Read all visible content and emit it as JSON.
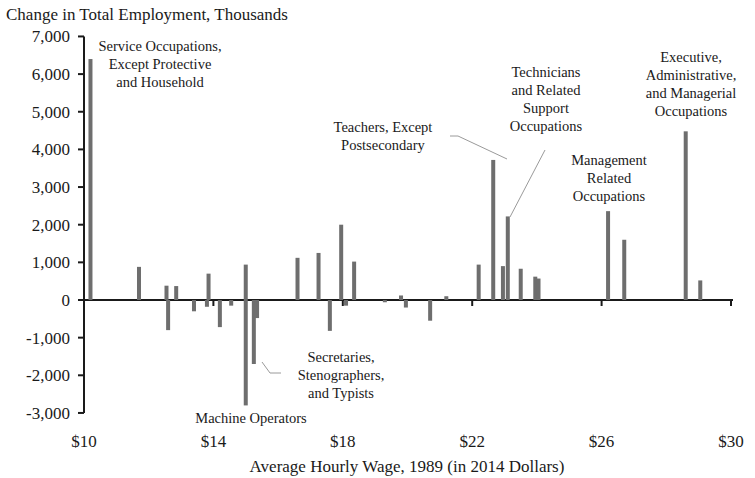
{
  "chart_data": {
    "type": "bar",
    "title": "",
    "ylabel": "Change in Total Employment, Thousands",
    "xlabel": "Average Hourly Wage, 1989 (in 2014 Dollars)",
    "ylim": [
      -3000,
      7000
    ],
    "xlim": [
      10,
      30
    ],
    "yticks": [
      7000,
      6000,
      5000,
      4000,
      3000,
      2000,
      1000,
      0,
      -1000,
      -2000,
      -3000
    ],
    "ytick_labels": [
      "7,000",
      "6,000",
      "5,000",
      "4,000",
      "3,000",
      "2,000",
      "1,000",
      "0",
      "-1,000",
      "-2,000",
      "-3,000"
    ],
    "xticks": [
      10,
      14,
      18,
      22,
      26,
      30
    ],
    "xtick_labels": [
      "$10",
      "$14",
      "$18",
      "$22",
      "$26",
      "$30"
    ],
    "grid": false,
    "legend": null,
    "points": [
      {
        "x": 10.2,
        "y": 6400
      },
      {
        "x": 11.7,
        "y": 880
      },
      {
        "x": 12.55,
        "y": 380
      },
      {
        "x": 12.6,
        "y": -800
      },
      {
        "x": 12.85,
        "y": 370
      },
      {
        "x": 13.4,
        "y": -300
      },
      {
        "x": 13.8,
        "y": -180
      },
      {
        "x": 13.85,
        "y": 700
      },
      {
        "x": 14.2,
        "y": -720
      },
      {
        "x": 14.55,
        "y": -150
      },
      {
        "x": 15.0,
        "y": 940
      },
      {
        "x": 15.0,
        "y": -2800
      },
      {
        "x": 15.25,
        "y": -1700
      },
      {
        "x": 15.35,
        "y": -480
      },
      {
        "x": 16.6,
        "y": 1120
      },
      {
        "x": 17.25,
        "y": 1250
      },
      {
        "x": 17.6,
        "y": -820
      },
      {
        "x": 17.95,
        "y": 2000
      },
      {
        "x": 18.1,
        "y": -150
      },
      {
        "x": 18.35,
        "y": 1020
      },
      {
        "x": 19.3,
        "y": -60
      },
      {
        "x": 19.8,
        "y": 120
      },
      {
        "x": 19.95,
        "y": -200
      },
      {
        "x": 20.7,
        "y": -550
      },
      {
        "x": 21.2,
        "y": 100
      },
      {
        "x": 22.2,
        "y": 940
      },
      {
        "x": 22.65,
        "y": 3720
      },
      {
        "x": 22.95,
        "y": 900
      },
      {
        "x": 23.1,
        "y": 2220
      },
      {
        "x": 23.5,
        "y": 830
      },
      {
        "x": 23.95,
        "y": 620
      },
      {
        "x": 24.05,
        "y": 570
      },
      {
        "x": 26.2,
        "y": 2360
      },
      {
        "x": 26.7,
        "y": 1600
      },
      {
        "x": 28.6,
        "y": 4480
      },
      {
        "x": 29.05,
        "y": 520
      }
    ],
    "annotations": [
      {
        "text": "Service Occupations, Except Protective and Household",
        "x": 10.2,
        "y": 6400
      },
      {
        "text": "Teachers, Except Postsecondary",
        "x": 22.65,
        "y": 3720
      },
      {
        "text": "Technicians and Related Support Occupations",
        "x": 23.1,
        "y": 2220
      },
      {
        "text": "Management Related Occupations",
        "x": 26.2,
        "y": 2360
      },
      {
        "text": "Executive, Administrative, and Managerial Occupations",
        "x": 28.6,
        "y": 4480
      },
      {
        "text": "Secretaries, Stenographers, and Typists",
        "x": 15.25,
        "y": -1700
      },
      {
        "text": "Machine Operators",
        "x": 15.0,
        "y": -2800
      }
    ]
  },
  "labels": {
    "ylabel": "Change in Total Employment, Thousands",
    "xlabel": "Average Hourly Wage, 1989 (in 2014 Dollars)",
    "ann_service": [
      "Service Occupations,",
      "Except Protective",
      "and Household"
    ],
    "ann_teachers": [
      "Teachers, Except",
      "Postsecondary"
    ],
    "ann_technicians": [
      "Technicians",
      "and Related",
      "Support",
      "Occupations"
    ],
    "ann_management": [
      "Management",
      "Related",
      "Occupations"
    ],
    "ann_executive": [
      "Executive,",
      "Administrative,",
      "and Managerial",
      "Occupations"
    ],
    "ann_secretaries": [
      "Secretaries,",
      "Stenographers,",
      "and Typists"
    ],
    "ann_machine": [
      "Machine Operators"
    ]
  },
  "colors": {
    "bar": "#6e6e6e",
    "axis": "#1a1a1a",
    "leader": "#9a9a9a"
  }
}
